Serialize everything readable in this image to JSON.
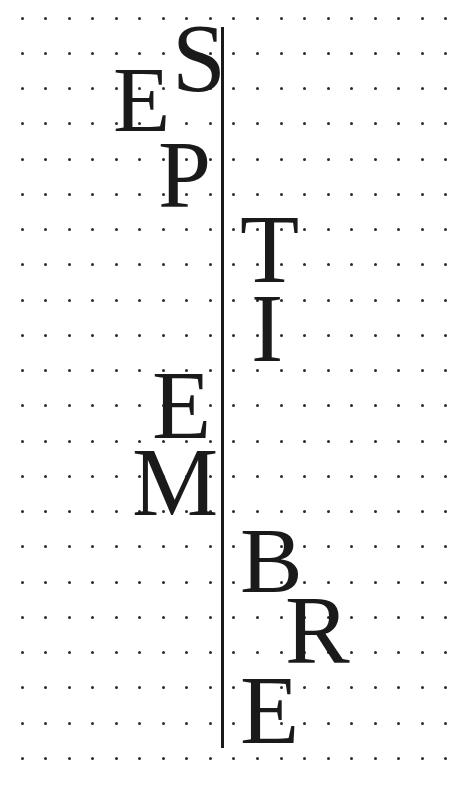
{
  "word": "SEPTIEMBRE",
  "colors": {
    "background": "#ffffff",
    "ink": "#1a1a1a",
    "dot": "#2a2a2a"
  },
  "grid": {
    "x0": 22,
    "dx": 23.55,
    "cols": 19,
    "y0": 18,
    "dy": 35.25,
    "rows": 22
  },
  "rule": {
    "x": 221,
    "y_top": 27,
    "y_bottom": 748,
    "width": 3
  },
  "letters": [
    {
      "char": "S",
      "left": 172,
      "top": 34,
      "height": 64
    },
    {
      "char": "E",
      "left": 113,
      "top": 75,
      "height": 62
    },
    {
      "char": "P",
      "left": 158,
      "top": 150,
      "height": 63
    },
    {
      "char": "T",
      "left": 240,
      "top": 225,
      "height": 64
    },
    {
      "char": "I",
      "left": 251,
      "top": 304,
      "height": 64
    },
    {
      "char": "E",
      "left": 152,
      "top": 381,
      "height": 64
    },
    {
      "char": "M",
      "left": 132,
      "top": 458,
      "height": 64
    },
    {
      "char": "B",
      "left": 240,
      "top": 536,
      "height": 62
    },
    {
      "char": "R",
      "left": 285,
      "top": 606,
      "height": 64
    },
    {
      "char": "E",
      "left": 240,
      "top": 686,
      "height": 64
    }
  ]
}
